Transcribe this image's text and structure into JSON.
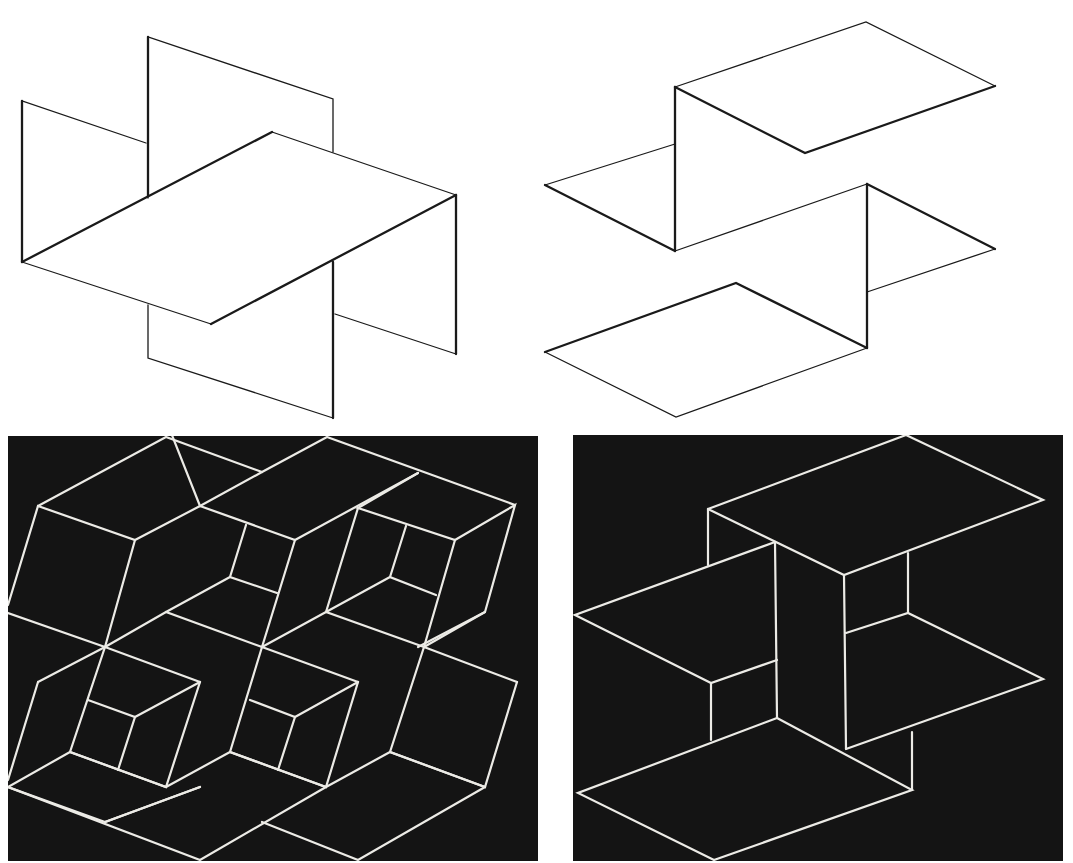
{
  "figure": {
    "panels": [
      {
        "id": "top-left",
        "style": "black lines on white",
        "subject": "horizontal rhombus plane intersected by two vertical planes"
      },
      {
        "id": "top-right",
        "style": "black lines on white",
        "subject": "stepped Z-shaped folded planes"
      },
      {
        "id": "bottom-left",
        "style": "white lines on black",
        "subject": "repeating ambiguous isometric boxes tiling"
      },
      {
        "id": "bottom-right",
        "style": "white lines on black",
        "subject": "interlocking ambiguous box structure"
      }
    ],
    "colors": {
      "background": "#ffffff",
      "line_dark": "#1a1a1a",
      "panel_dark": "#141414",
      "line_light": "#ecebe6"
    }
  }
}
